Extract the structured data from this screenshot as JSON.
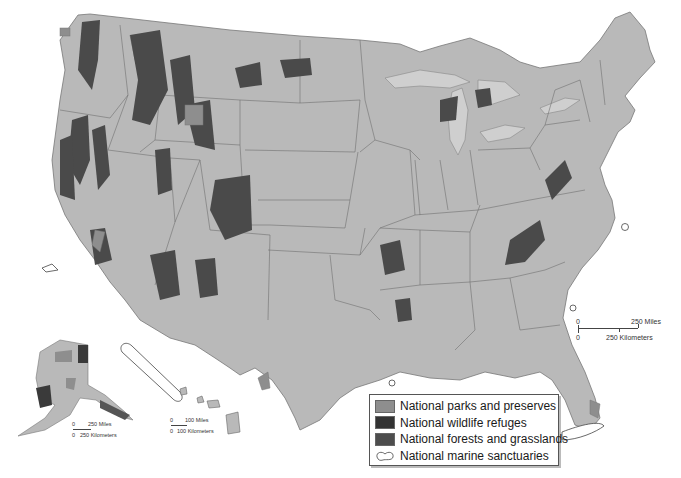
{
  "map": {
    "title": "",
    "region": "United States",
    "colors": {
      "land": "#b9b9b9",
      "state_border": "#6e6e6e",
      "water": "#ffffff",
      "lakes": "#c8c8c8",
      "parks": "#8e8e8e",
      "wildlife_refuges": "#3a3a3a",
      "forests": "#4a4a4a",
      "marine_outline": "#444444"
    }
  },
  "legend": {
    "items": [
      {
        "label": "National parks and preserves",
        "color": "#8e8e8e",
        "icon": "filled-square"
      },
      {
        "label": "National wildlife refuges",
        "color": "#333333",
        "icon": "filled-square"
      },
      {
        "label": "National forests and grasslands",
        "color": "#4d4d4d",
        "icon": "filled-square"
      },
      {
        "label": "National marine sanctuaries",
        "color": "#ffffff",
        "icon": "outline-blob"
      }
    ]
  },
  "scales": {
    "conus": {
      "zero_top": "0",
      "miles": "250 Miles",
      "zero_bottom": "0",
      "km": "250 Kilometers"
    },
    "alaska": {
      "zero_top": "0",
      "miles": "250 Miles",
      "zero_bottom": "0",
      "km": "250 Kilometers"
    },
    "hawaii": {
      "zero_top": "0",
      "miles": "100 Miles",
      "zero_bottom": "0",
      "km": "100 Kilometers"
    }
  }
}
